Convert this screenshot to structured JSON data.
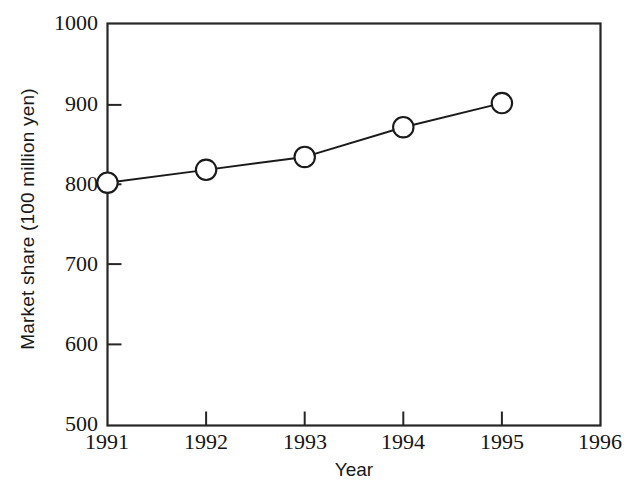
{
  "chart_data": {
    "type": "line",
    "title": "",
    "subtitle": "",
    "xlabel": "Year",
    "ylabel": "Market share (100 million yen)",
    "x": [
      1991,
      1992,
      1993,
      1994,
      1995
    ],
    "values": [
      802,
      818,
      834,
      871,
      901
    ],
    "series": [
      {
        "name": "Market share",
        "x": [
          1991,
          1992,
          1993,
          1994,
          1995
        ],
        "values": [
          802,
          818,
          834,
          871,
          901
        ],
        "marker": "open-circle",
        "line_color": "#1a1a1a",
        "marker_face_color": "#ffffff",
        "marker_edge_color": "#1a1a1a"
      }
    ],
    "xlim": [
      1991,
      1996
    ],
    "ylim": [
      500,
      1000
    ],
    "xticks": [
      1991,
      1992,
      1993,
      1994,
      1995,
      1996
    ],
    "xtick_labels": [
      "1991",
      "1992",
      "1993",
      "1994",
      "1995",
      "1996"
    ],
    "yticks": [
      500,
      600,
      700,
      800,
      900,
      1000
    ],
    "ytick_labels": [
      "500",
      "600",
      "700",
      "800",
      "900",
      "1000"
    ],
    "grid": false,
    "legend": null,
    "legend_position": "none",
    "tick_direction": "in",
    "frame": "box",
    "annotations": []
  },
  "colors": {
    "background": "#ffffff",
    "ink": "#1a1a1a",
    "axis": "#262626",
    "marker_fill": "#ffffff"
  }
}
